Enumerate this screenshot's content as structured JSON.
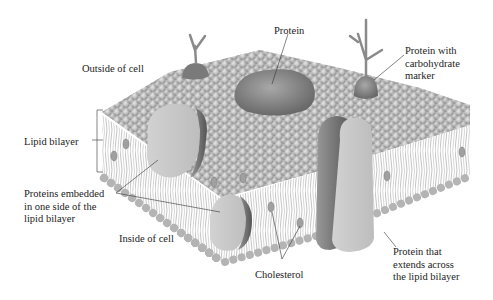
{
  "diagram": {
    "labels": {
      "outside_cell": "Outside of cell",
      "protein": "Protein",
      "protein_carb_1": "Protein with",
      "protein_carb_2": "carbohydrate",
      "protein_carb_3": "marker",
      "lipid_bilayer": "Lipid bilayer",
      "embedded_1": "Proteins embedded",
      "embedded_2": "in one side of the",
      "embedded_3": "lipid bilayer",
      "inside_cell": "Inside of cell",
      "cholesterol": "Cholesterol",
      "transmembrane_1": "Protein that",
      "transmembrane_2": "extends across",
      "transmembrane_3": "the lipid bilayer"
    },
    "colors": {
      "head": "#b8b8b8",
      "head_shade": "#8c8c8c",
      "protein_light": "#cfcfcf",
      "protein_dark": "#6e6e6e",
      "leader": "#333333"
    }
  }
}
